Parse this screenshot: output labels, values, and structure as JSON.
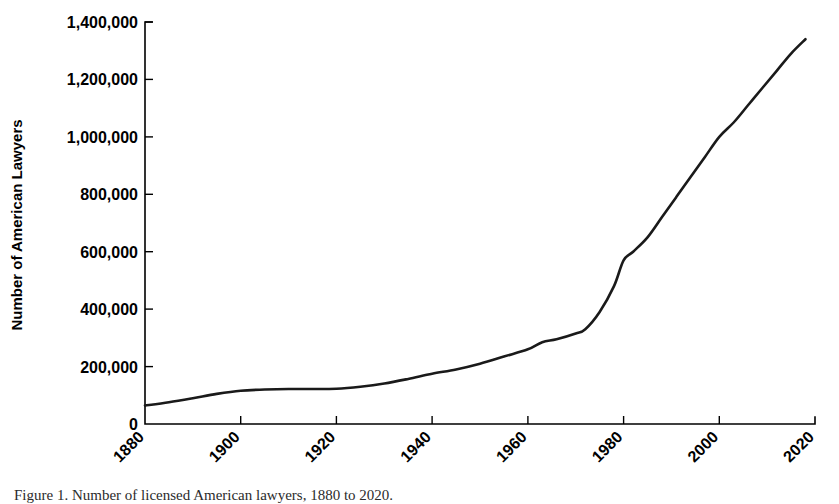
{
  "figure": {
    "caption": "Figure 1.  Number of licensed American lawyers, 1880 to 2020.",
    "background_color": "#ffffff",
    "line_color": "#1a1a1a",
    "axis_color": "#000000"
  },
  "chart_data": {
    "type": "line",
    "title": "",
    "xlabel": "",
    "ylabel": "Number of American Lawyers",
    "xlim": [
      1880,
      2020
    ],
    "ylim": [
      0,
      1400000
    ],
    "grid": false,
    "legend": "none",
    "x_ticks": [
      1880,
      1900,
      1920,
      1940,
      1960,
      1980,
      2000,
      2020
    ],
    "x_tick_labels": [
      "1880",
      "1900",
      "1920",
      "1940",
      "1960",
      "1980",
      "2000",
      "2020"
    ],
    "x_tick_rotation": 45,
    "y_ticks": [
      0,
      200000,
      400000,
      600000,
      800000,
      1000000,
      1200000,
      1400000
    ],
    "y_tick_labels": [
      "0",
      "200,000",
      "400,000",
      "600,000",
      "800,000",
      "1,000,000",
      "1,200,000",
      "1,400,000"
    ],
    "series": [
      {
        "name": "Number of American Lawyers",
        "x": [
          1880,
          1885,
          1890,
          1895,
          1900,
          1905,
          1910,
          1915,
          1920,
          1925,
          1930,
          1935,
          1940,
          1945,
          1950,
          1955,
          1960,
          1963,
          1966,
          1970,
          1972,
          1975,
          1978,
          1980,
          1982,
          1985,
          1988,
          1991,
          1994,
          1997,
          2000,
          2003,
          2006,
          2009,
          2012,
          2015,
          2018
        ],
        "y": [
          64000,
          76000,
          90000,
          105000,
          116000,
          120000,
          122000,
          122000,
          123000,
          130000,
          141000,
          157000,
          175000,
          190000,
          210000,
          235000,
          260000,
          285000,
          295000,
          315000,
          330000,
          390000,
          480000,
          570000,
          600000,
          650000,
          720000,
          790000,
          860000,
          930000,
          1000000,
          1050000,
          1110000,
          1170000,
          1230000,
          1290000,
          1340000
        ],
        "color": "#1a1a1a",
        "style": "solid"
      }
    ],
    "annotations": [
      {
        "text": "flat plateau 1900-1925",
        "x_range": [
          1900,
          1925
        ],
        "value": "approximately 120,000"
      },
      {
        "text": "sharp inflection after 1970",
        "x_range": [
          1970,
          1985
        ]
      },
      {
        "text": "endpoint",
        "x": 2018,
        "value": 1340000
      }
    ]
  }
}
